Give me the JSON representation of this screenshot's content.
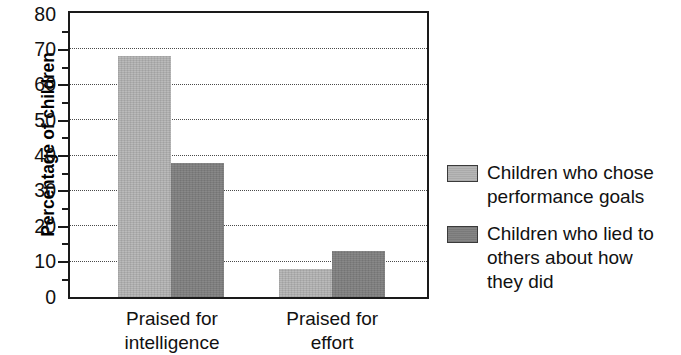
{
  "chart_data": {
    "type": "bar",
    "title": "",
    "subtitle": "",
    "xlabel": "",
    "ylabel": "Percentage of children",
    "categories": [
      "Praised for\nintelligence",
      "Praised for\neffort"
    ],
    "series": [
      {
        "name": "Children who chose\nperformance goals",
        "values": [
          68,
          8
        ],
        "color": "#b3b3b3"
      },
      {
        "name": "Children who lied to\nothers about how\nthey did",
        "values": [
          38,
          13
        ],
        "color": "#808080"
      }
    ],
    "ylim": [
      0,
      80
    ],
    "ytick_labels": [
      "80",
      "70",
      "60",
      "50",
      "40",
      "30",
      "20",
      "10",
      "0"
    ],
    "ytick_values": [
      80,
      70,
      60,
      50,
      40,
      30,
      20,
      10,
      0
    ],
    "yminor_tick_values": [
      75,
      65,
      55,
      45,
      35,
      25,
      15,
      5
    ],
    "grid": "horizontal-dotted",
    "gridline_values": [
      70,
      60,
      50,
      40,
      30,
      20,
      10
    ],
    "legend_position": "right",
    "frame": "box"
  },
  "axis": {
    "y_title": "Percentage of children"
  },
  "legend": {
    "entries": [
      {
        "label": "Children who chose\nperformance goals",
        "swatch": "light-gray-swatch"
      },
      {
        "label": "Children who lied to\nothers about how\nthey did",
        "swatch": "dark-gray-swatch"
      }
    ]
  }
}
